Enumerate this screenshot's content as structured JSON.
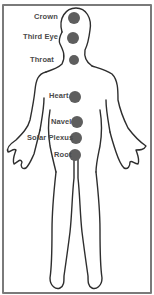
{
  "diagram": {
    "type": "chakra-body-map",
    "line_color": "#2e2e2e",
    "dot_color": "#5e5e5e",
    "frame_color": "#7a7a7a",
    "chakras": [
      {
        "name": "Crown",
        "x": 74,
        "y": 18,
        "r": 6,
        "label_x": 34,
        "label_y": 13
      },
      {
        "name": "Third Eye",
        "x": 73,
        "y": 38,
        "r": 6,
        "label_x": 23,
        "label_y": 33
      },
      {
        "name": "Throat",
        "x": 74,
        "y": 60,
        "r": 5,
        "label_x": 30,
        "label_y": 56
      },
      {
        "name": "Heart",
        "x": 75,
        "y": 97,
        "r": 6,
        "label_x": 49,
        "label_y": 92
      },
      {
        "name": "Navel",
        "x": 77,
        "y": 122,
        "r": 6,
        "label_x": 51,
        "label_y": 118
      },
      {
        "name": "Solar Plexus",
        "x": 76,
        "y": 138,
        "r": 6,
        "label_x": 27,
        "label_y": 134
      },
      {
        "name": "Root",
        "x": 75,
        "y": 155,
        "r": 6,
        "label_x": 54,
        "label_y": 151
      }
    ]
  }
}
